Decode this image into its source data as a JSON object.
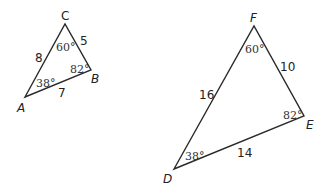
{
  "figure": {
    "triangles": [
      {
        "name": "ABC",
        "vertices": [
          {
            "label": "A",
            "x": 25,
            "y": 97,
            "lx": 17,
            "ly": 112
          },
          {
            "label": "B",
            "x": 91,
            "y": 70,
            "lx": 91,
            "ly": 83
          },
          {
            "label": "C",
            "x": 65,
            "y": 24,
            "lx": 61,
            "ly": 20
          }
        ],
        "sides": [
          {
            "between": "AC",
            "length": "8",
            "lx": 35,
            "ly": 62
          },
          {
            "between": "CB",
            "length": "5",
            "lx": 80,
            "ly": 45
          },
          {
            "between": "AB",
            "length": "7",
            "lx": 58,
            "ly": 97
          }
        ],
        "angles": [
          {
            "at": "C",
            "value": "60°",
            "lx": 56,
            "ly": 51
          },
          {
            "at": "B",
            "value": "82°",
            "lx": 70,
            "ly": 73
          },
          {
            "at": "A",
            "value": "38°",
            "lx": 36,
            "ly": 87
          }
        ]
      },
      {
        "name": "DEF",
        "vertices": [
          {
            "label": "D",
            "x": 174,
            "y": 169,
            "lx": 163,
            "ly": 183
          },
          {
            "label": "E",
            "x": 304,
            "y": 116,
            "lx": 306,
            "ly": 129
          },
          {
            "label": "F",
            "x": 254,
            "y": 26,
            "lx": 250,
            "ly": 22
          }
        ],
        "sides": [
          {
            "between": "DF",
            "length": "16",
            "lx": 199,
            "ly": 99
          },
          {
            "between": "FE",
            "length": "10",
            "lx": 280,
            "ly": 71
          },
          {
            "between": "DE",
            "length": "14",
            "lx": 237,
            "ly": 157
          }
        ],
        "angles": [
          {
            "at": "F",
            "value": "60°",
            "lx": 245,
            "ly": 53
          },
          {
            "at": "E",
            "value": "82°",
            "lx": 283,
            "ly": 119
          },
          {
            "at": "D",
            "value": "38°",
            "lx": 185,
            "ly": 160
          }
        ]
      }
    ]
  }
}
